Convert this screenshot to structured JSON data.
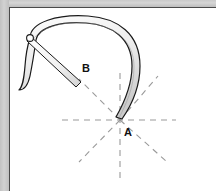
{
  "diagram": {
    "kind": "technical-line-drawing",
    "background_color": "#ffffff",
    "frame": {
      "top_band_color": "#d2d2d2",
      "left_band_color": "#c8c8c8",
      "inner_rule_color": "#4a4a4a",
      "top_band_height_px": 7,
      "left_band_width_px": 9
    },
    "labels": [
      {
        "id": "A",
        "text": "A",
        "x": 124,
        "y": 127,
        "meaning": "blade-tip-pivot-point"
      },
      {
        "id": "B",
        "text": "B",
        "x": 82,
        "y": 63,
        "meaning": "handle-rod-end-point"
      }
    ],
    "colors": {
      "outline": "#1a1a1a",
      "blade_fill_light": "#fbfbfb",
      "blade_fill_shade": "#cfcfcf",
      "dashed_guide": "#9a9a9a",
      "label_text": "#101010"
    },
    "shapes": {
      "blade": {
        "name": "curved-scythe-blade",
        "description": "Wide arc sweeping from lower-left hook up over the top and down to the tip at point A",
        "fill": "#f4f4f4",
        "stroke": "#1a1a1a",
        "stroke_width": 1.2
      },
      "handle": {
        "name": "straight-handle-rod",
        "description": "Narrow straight bar from the pivot circle at upper left down to point B",
        "fill": "#f6f6f6",
        "stroke": "#1a1a1a",
        "stroke_width": 1
      },
      "pivot": {
        "name": "pivot-circle",
        "cx": 30,
        "cy": 38,
        "r": 3.2,
        "fill": "#ffffff",
        "stroke": "#1a1a1a"
      }
    },
    "guides": {
      "dash_pattern": "6 5",
      "stroke": "#9a9a9a",
      "stroke_width": 1.1,
      "center": {
        "x": 120,
        "y": 120
      },
      "lines": [
        {
          "name": "horizontal-guide",
          "x1": 62,
          "y1": 120,
          "x2": 176,
          "y2": 120
        },
        {
          "name": "vertical-guide",
          "x1": 120,
          "y1": 73,
          "x2": 120,
          "y2": 181
        },
        {
          "name": "diagonal-up-right-guide",
          "x1": 120,
          "y1": 120,
          "x2": 158,
          "y2": 76
        },
        {
          "name": "diagonal-down-right-guide",
          "x1": 120,
          "y1": 120,
          "x2": 166,
          "y2": 160
        },
        {
          "name": "diagonal-down-left-guide",
          "x1": 120,
          "y1": 120,
          "x2": 80,
          "y2": 162
        },
        {
          "name": "diagonal-up-left-to-B-guide",
          "x1": 120,
          "y1": 120,
          "x2": 78,
          "y2": 78
        }
      ]
    }
  }
}
